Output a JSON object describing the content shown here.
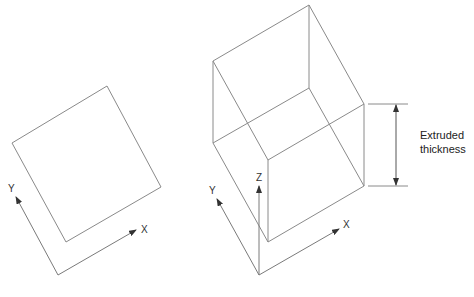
{
  "left_figure": {
    "name": "square-profile",
    "axes": {
      "x_label": "X",
      "y_label": "Y"
    }
  },
  "right_figure": {
    "name": "extruded-box",
    "axes": {
      "x_label": "X",
      "y_label": "Y",
      "z_label": "Z"
    }
  },
  "dimension": {
    "label_line1": "Extruded",
    "label_line2": "thickness"
  },
  "colors": {
    "line": "#8a8a8a",
    "text": "#333333"
  }
}
